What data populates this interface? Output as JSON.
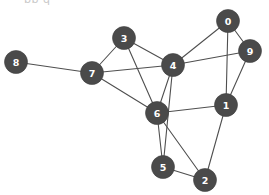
{
  "figure": {
    "title_partial": "bb q",
    "background_color": "#ffffff",
    "node_color": "#4a4a4a",
    "node_label_color": "#ffffff",
    "edge_color": "#4f4f4f",
    "node_radius": 11.5
  },
  "chart_data": {
    "type": "scatter",
    "graph_type": "node-link-diagram",
    "title": "",
    "xlabel": "",
    "ylabel": "",
    "grid": false,
    "legend": "none",
    "xlim": [
      0,
      269
    ],
    "ylim": [
      0,
      195
    ],
    "nodes": [
      {
        "id": "0",
        "label": "0",
        "x": 228,
        "y": 21,
        "degree": 3
      },
      {
        "id": "1",
        "label": "1",
        "x": 226,
        "y": 105,
        "degree": 5
      },
      {
        "id": "2",
        "label": "2",
        "x": 205,
        "y": 180,
        "degree": 3
      },
      {
        "id": "3",
        "label": "3",
        "x": 124,
        "y": 38,
        "degree": 3
      },
      {
        "id": "4",
        "label": "4",
        "x": 173,
        "y": 65,
        "degree": 7
      },
      {
        "id": "5",
        "label": "5",
        "x": 163,
        "y": 167,
        "degree": 3
      },
      {
        "id": "6",
        "label": "6",
        "x": 157,
        "y": 113,
        "degree": 8
      },
      {
        "id": "7",
        "label": "7",
        "x": 92,
        "y": 73,
        "degree": 4
      },
      {
        "id": "8",
        "label": "8",
        "x": 16,
        "y": 62,
        "degree": 1
      },
      {
        "id": "9",
        "label": "9",
        "x": 250,
        "y": 51,
        "degree": 3
      }
    ],
    "edges": [
      {
        "source": "0",
        "target": "9"
      },
      {
        "source": "0",
        "target": "4"
      },
      {
        "source": "0",
        "target": "1"
      },
      {
        "source": "9",
        "target": "4"
      },
      {
        "source": "9",
        "target": "1"
      },
      {
        "source": "1",
        "target": "6"
      },
      {
        "source": "1",
        "target": "2"
      },
      {
        "source": "4",
        "target": "3"
      },
      {
        "source": "4",
        "target": "7"
      },
      {
        "source": "4",
        "target": "6"
      },
      {
        "source": "4",
        "target": "5"
      },
      {
        "source": "3",
        "target": "7"
      },
      {
        "source": "3",
        "target": "6"
      },
      {
        "source": "7",
        "target": "8"
      },
      {
        "source": "7",
        "target": "6"
      },
      {
        "source": "6",
        "target": "5"
      },
      {
        "source": "6",
        "target": "2"
      },
      {
        "source": "5",
        "target": "2"
      }
    ],
    "node_count": 10,
    "edge_count": 18
  }
}
